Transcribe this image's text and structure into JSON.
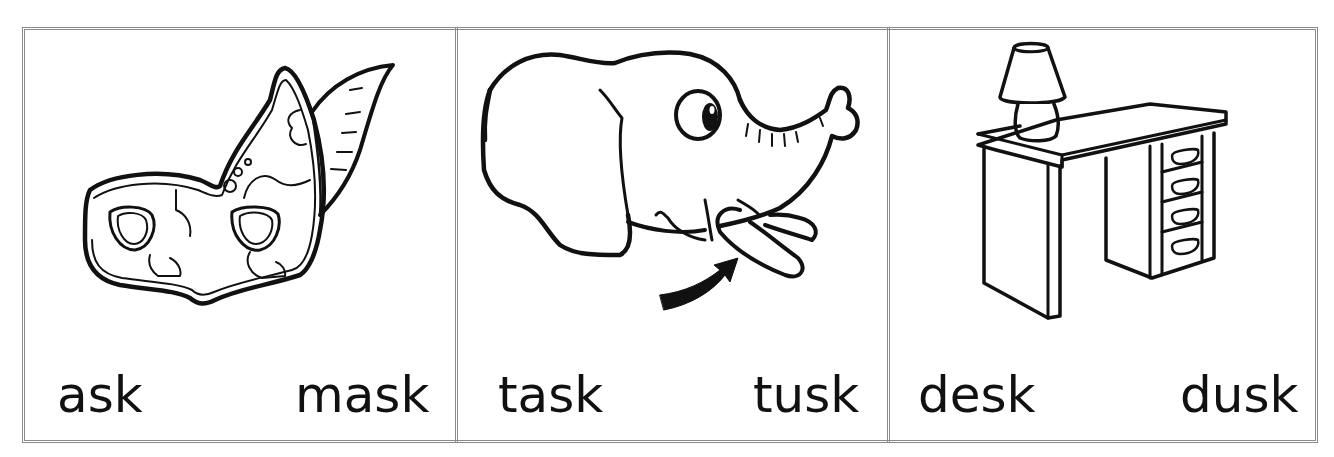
{
  "worksheet": {
    "panels": [
      {
        "id": "mask",
        "picture": "mask-illustration",
        "words": {
          "left": "ask",
          "right": "mask"
        }
      },
      {
        "id": "tusk",
        "picture": "elephant-illustration",
        "words": {
          "left": "task",
          "right": "tusk"
        }
      },
      {
        "id": "desk",
        "picture": "desk-illustration",
        "words": {
          "left": "desk",
          "right": "dusk"
        }
      }
    ],
    "colors": {
      "ink": "#111111",
      "border": "#8a8a8a",
      "background": "#ffffff"
    }
  }
}
